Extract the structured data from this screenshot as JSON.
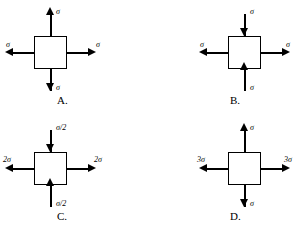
{
  "figure": {
    "type": "stress-element-multiple-choice",
    "panel_count": 4,
    "background_color": "#ffffff",
    "line_color": "#000000"
  },
  "panels": [
    {
      "id": "A",
      "choice_label": "A.",
      "arrows": {
        "top": {
          "label": "σ",
          "direction": "outward",
          "points": "up"
        },
        "bottom": {
          "label": "σ",
          "direction": "outward",
          "points": "down"
        },
        "left": {
          "label": "σ",
          "direction": "outward",
          "points": "left"
        },
        "right": {
          "label": "σ",
          "direction": "outward",
          "points": "right"
        }
      }
    },
    {
      "id": "B",
      "choice_label": "B.",
      "arrows": {
        "top": {
          "label": "σ",
          "direction": "inward",
          "points": "down"
        },
        "bottom": {
          "label": "σ",
          "direction": "inward",
          "points": "up"
        },
        "left": {
          "label": "σ",
          "direction": "outward",
          "points": "left"
        },
        "right": {
          "label": "σ",
          "direction": "outward",
          "points": "right"
        }
      }
    },
    {
      "id": "C",
      "choice_label": "C.",
      "arrows": {
        "top": {
          "label": "σ/2",
          "direction": "inward",
          "points": "down"
        },
        "bottom": {
          "label": "σ/2",
          "direction": "inward",
          "points": "up"
        },
        "left": {
          "label": "2σ",
          "direction": "outward",
          "points": "left"
        },
        "right": {
          "label": "2σ",
          "direction": "outward",
          "points": "right"
        }
      }
    },
    {
      "id": "D",
      "choice_label": "D.",
      "arrows": {
        "top": {
          "label": "σ",
          "direction": "outward",
          "points": "up"
        },
        "bottom": {
          "label": "σ",
          "direction": "outward",
          "points": "down"
        },
        "left": {
          "label": "3σ",
          "direction": "outward",
          "points": "left"
        },
        "right": {
          "label": "3σ",
          "direction": "outward",
          "points": "right"
        }
      }
    }
  ]
}
